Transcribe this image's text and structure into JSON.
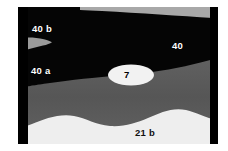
{
  "figure": {
    "type": "geologic-cross-section",
    "width": 228,
    "height": 151,
    "background_color": "#ffffff"
  },
  "labels": {
    "unit_40b": "40 b",
    "unit_40a": "40 a",
    "unit_40": "40",
    "unit_7": "7",
    "unit_21b": "21 b"
  },
  "colors": {
    "black_unit": "#050505",
    "gray_unit": "#585858",
    "light_unit": "#eeeeee",
    "wedge_gray": "#9a9a9a",
    "top_wedge_gray": "#a8a8a8",
    "lens_white": "#f2f2f2",
    "border_bar": "#000000",
    "label_light": "#ffffff",
    "label_dark": "#111111"
  },
  "units": [
    {
      "id": "40b",
      "label": "40 b",
      "fill": "#050505",
      "description": "uppermost dark unit"
    },
    {
      "id": "40a",
      "label": "40 a",
      "fill": "#050505",
      "description": "dark unit below wedge"
    },
    {
      "id": "40",
      "label": "40",
      "fill": "#050505",
      "description": "dark unit right side"
    },
    {
      "id": "7",
      "label": "7",
      "fill": "#f2f2f2",
      "description": "white lens within dark unit"
    },
    {
      "id": "21b",
      "label": "21 b",
      "fill": "#eeeeee",
      "description": "light basal unit"
    }
  ],
  "shapes": {
    "left_bar": {
      "x": 18,
      "y": 7,
      "width": 10,
      "height": 137
    },
    "right_bar": {
      "x": 210,
      "y": 7,
      "width": 8,
      "height": 137
    },
    "gray_wedge_left": {
      "x": 20,
      "y": 38,
      "width": 32,
      "height": 14
    },
    "top_gray_wedge": {
      "from_x": 80,
      "to_x": 213,
      "max_thickness": 11
    },
    "white_lens": {
      "cx": 131,
      "cy": 75,
      "rx": 23,
      "ry": 10
    }
  }
}
